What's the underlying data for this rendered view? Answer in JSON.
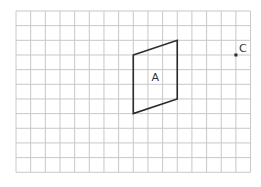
{
  "grid": {
    "origin_x": 16,
    "origin_y": 11,
    "cell": 14.66,
    "cols": 16,
    "rows": 11,
    "line_color": "#c8c8c8"
  },
  "shapes": [
    {
      "id": "A",
      "label": "A",
      "type": "parallelogram",
      "vertices": [
        [
          8,
          3
        ],
        [
          11,
          2
        ],
        [
          11,
          6
        ],
        [
          8,
          7
        ]
      ],
      "stroke": "#2a2a2a"
    }
  ],
  "points": [
    {
      "id": "C",
      "label": "C",
      "x": 15,
      "y": 3,
      "color": "#2a2a2a"
    }
  ]
}
